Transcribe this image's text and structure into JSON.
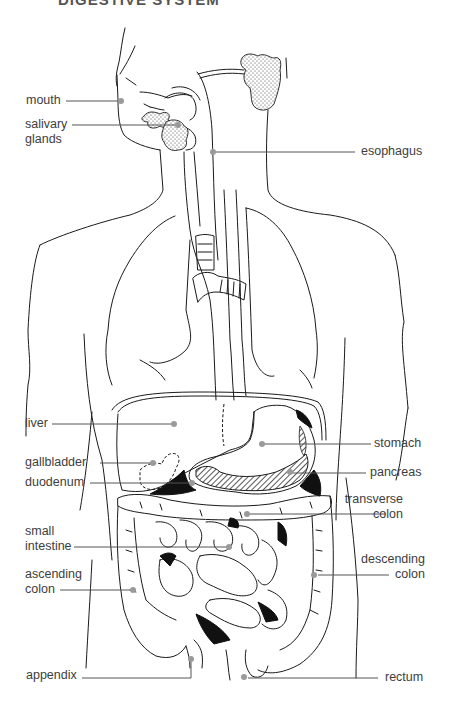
{
  "title": "DIGESTIVE SYSTEM",
  "diagram": {
    "labels": {
      "mouth": "mouth",
      "salivary_1": "salivary",
      "salivary_2": "glands",
      "esophagus": "esophagus",
      "liver": "liver",
      "stomach": "stomach",
      "gallbladder": "gallbladder",
      "pancreas": "pancreas",
      "duodenum": "duodenum",
      "transverse_1": "transverse",
      "transverse_2": "colon",
      "small_1": "small",
      "small_2": "intestine",
      "ascending_1": "ascending",
      "ascending_2": "colon",
      "descending_1": "descending",
      "descending_2": "colon",
      "appendix": "appendix",
      "rectum": "rectum"
    },
    "colors": {
      "line": "#1a1a1a",
      "leader": "#555555",
      "pointer_dot": "#9a9a9a",
      "label_text": "#3d3d3d"
    }
  }
}
